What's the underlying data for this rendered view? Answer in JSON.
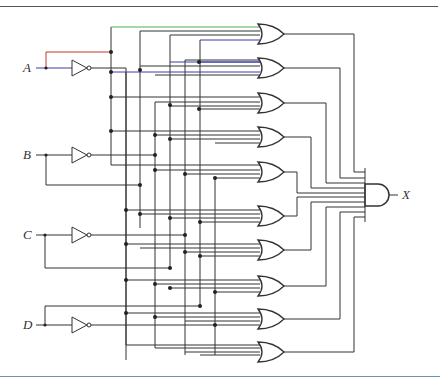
{
  "diagram": {
    "type": "logic-circuit",
    "inputs": [
      {
        "label": "A",
        "y": 68
      },
      {
        "label": "B",
        "y": 155
      },
      {
        "label": "C",
        "y": 235
      },
      {
        "label": "D",
        "y": 325
      }
    ],
    "output": {
      "label": "X"
    },
    "or_gate_count": 10,
    "and_gate_count": 1,
    "inverter_count": 4,
    "colors": {
      "wire": "#333333",
      "highlight_red": "#c0392b",
      "highlight_blue": "#3a3aa8",
      "highlight_green": "#4caf50",
      "rule_top": "#555555",
      "rule_bottom": "#6b93b8"
    }
  }
}
